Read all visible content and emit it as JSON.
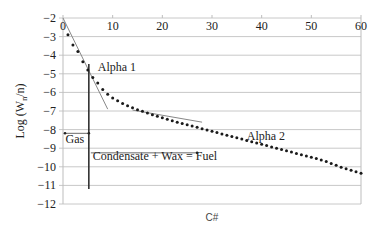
{
  "chart_data": {
    "type": "scatter",
    "title": "",
    "xlabel": "C#",
    "ylabel": "Log (W_n/n)",
    "ylabel_main": "Log (W",
    "ylabel_sub": "n",
    "ylabel_end": "/n)",
    "xlim": [
      0,
      60
    ],
    "ylim": [
      -12,
      -2
    ],
    "xticks": [
      0,
      10,
      20,
      30,
      40,
      50,
      60
    ],
    "yticks": [
      -2,
      -3,
      -4,
      -5,
      -6,
      -7,
      -8,
      -9,
      -10,
      -11,
      -12
    ],
    "grid": "horizontal",
    "x": [
      1,
      2,
      3,
      4,
      5,
      6,
      7,
      8,
      9,
      10,
      11,
      12,
      13,
      14,
      15,
      16,
      17,
      18,
      19,
      20,
      21,
      22,
      23,
      24,
      25,
      26,
      27,
      28,
      29,
      30,
      31,
      32,
      33,
      34,
      35,
      36,
      37,
      38,
      39,
      40,
      41,
      42,
      43,
      44,
      45,
      46,
      47,
      48,
      49,
      50,
      51,
      52,
      53,
      54,
      55,
      56,
      57,
      58,
      59,
      60
    ],
    "values": [
      -2.9,
      -3.45,
      -3.8,
      -4.35,
      -4.8,
      -5.2,
      -5.5,
      -5.85,
      -6.1,
      -6.3,
      -6.45,
      -6.6,
      -6.72,
      -6.83,
      -6.93,
      -7.02,
      -7.11,
      -7.2,
      -7.28,
      -7.36,
      -7.44,
      -7.52,
      -7.6,
      -7.67,
      -7.74,
      -7.81,
      -7.88,
      -7.95,
      -8.02,
      -8.09,
      -8.16,
      -8.23,
      -8.3,
      -8.37,
      -8.44,
      -8.51,
      -8.58,
      -8.65,
      -8.72,
      -8.79,
      -8.86,
      -8.93,
      -9.0,
      -9.07,
      -9.14,
      -9.21,
      -9.28,
      -9.35,
      -9.42,
      -9.49,
      -9.56,
      -9.63,
      -9.72,
      -9.82,
      -9.92,
      -10.02,
      -10.1,
      -10.18,
      -10.26,
      -10.35
    ],
    "tangent_lines": [
      {
        "name": "Alpha 1",
        "from": [
          0,
          -2
        ],
        "to": [
          9,
          -6.9
        ]
      },
      {
        "name": "Alpha 2",
        "from": [
          14,
          -6.95
        ],
        "to": [
          28,
          -7.6
        ]
      }
    ],
    "cutoff_line": {
      "x": 5.2,
      "y_from": -2,
      "y_to": -11.2
    },
    "annotations": [
      {
        "text": "Alpha 1",
        "x": 7,
        "y": -4.85
      },
      {
        "text": "Alpha 2",
        "x": 37,
        "y": -8.55
      },
      {
        "text": "Gas",
        "x": 0.5,
        "y": -8.7
      },
      {
        "text": "Condensate + Wax = Fuel",
        "x": 6,
        "y": -9.65
      }
    ],
    "arrows": [
      {
        "name": "gas-range",
        "x_from": 0,
        "x_to": 5.2,
        "y": -8.2
      },
      {
        "name": "fuel-range",
        "x_from": 5.2,
        "x_to": 27,
        "y": -9.25
      }
    ]
  }
}
